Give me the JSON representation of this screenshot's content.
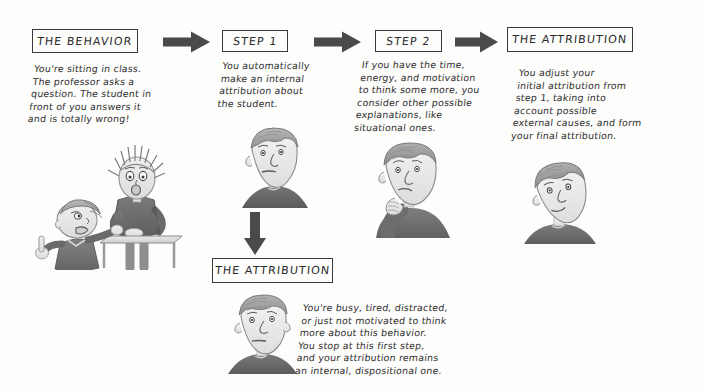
{
  "diagram": {
    "ink_color": "#2e2e2e",
    "box_border_color": "#3a3a3a",
    "arrow_color": "#4a4a4a",
    "background": "#fdfdfc"
  },
  "boxes": {
    "behavior": "THE BEHAVIOR",
    "step1": "STEP 1",
    "step2": "STEP 2",
    "attribution_top": "THE ATTRIBUTION",
    "attribution_bottom": "THE ATTRIBUTION"
  },
  "notes": {
    "behavior": "You're sitting in class.\nThe professor asks a\nquestion. The student in\nfront of you answers it\nand is totally wrong!",
    "step1": "You automatically\nmake an internal\nattribution about\nthe student.",
    "step2": "If you have the time,\nenergy, and motivation\nto think some more, you\nconsider other possible\nexplanations, like\nsituational ones.",
    "attribution_top": "You adjust your\ninitial attribution from\nstep 1, taking into\naccount possible\nexternal causes, and form\nyour final attribution.",
    "attribution_bottom": "You're busy, tired, distracted,\nor just not motivated to think\nmore about this behavior.\nYou stop at this first step,\nand your attribution remains\nan internal, dispositional one."
  },
  "arrows": {
    "behavior_to_step1": "right-arrow",
    "step1_to_step2": "right-arrow",
    "step2_to_attribution": "right-arrow",
    "step1_to_attribution_bottom": "down-arrow"
  },
  "illustrations": {
    "classroom": "classroom-scene-professor-and-student",
    "step1_face": "neutral-face-portrait",
    "step2_face": "thinking-face-hand-on-chin",
    "attribution_top_face": "tilted-face-portrait",
    "attribution_bottom_face": "flat-face-portrait"
  }
}
